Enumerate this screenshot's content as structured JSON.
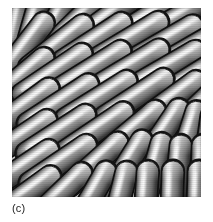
{
  "figure": {
    "caption_label": "(c)",
    "panel": {
      "alt_description": "Grayscale 3D rendering of densely packed spherocylindrical rods",
      "width_px": 189,
      "height_px": 189,
      "left_px": 12,
      "top_px": 8,
      "background_color": "#d9d9d9",
      "outline_color": "#141414",
      "rod_light_color": "#e9e9e9",
      "rod_mid_color": "#9a9a9a",
      "rod_dark_color": "#2e2e2e",
      "page_background": "#ffffff",
      "caption_color": "#1c1c1c"
    }
  },
  "chart_data": {
    "type": "scatter",
    "title": "",
    "subtitle": "",
    "xlabel": "",
    "ylabel": "",
    "xlim": [
      0,
      189
    ],
    "ylim": [
      0,
      189
    ],
    "grid": false,
    "legend": null,
    "annotations": [
      "(c)"
    ],
    "render": {
      "style": "shaded-spherocylinders",
      "light_azimuth_deg": 300,
      "rod_radius_px": 11,
      "rod_length_px": 62,
      "dominant_angle_deg": -32,
      "angle_field_note": "rods lie near -32 deg over most of the panel, rotating toward vertical (-90 deg) in the lower-right corner and near the upper-left edge"
    },
    "rods": [
      {
        "x": 6,
        "y": 10,
        "len": 54,
        "angle": -78
      },
      {
        "x": 24,
        "y": 6,
        "len": 50,
        "angle": -74
      },
      {
        "x": 44,
        "y": 12,
        "len": 58,
        "angle": -62
      },
      {
        "x": 70,
        "y": 8,
        "len": 60,
        "angle": -44
      },
      {
        "x": 100,
        "y": 6,
        "len": 64,
        "angle": -36
      },
      {
        "x": 134,
        "y": 10,
        "len": 66,
        "angle": -32
      },
      {
        "x": 168,
        "y": 8,
        "len": 58,
        "angle": -30
      },
      {
        "x": 12,
        "y": 40,
        "len": 62,
        "angle": -52
      },
      {
        "x": 44,
        "y": 38,
        "len": 66,
        "angle": -38
      },
      {
        "x": 80,
        "y": 34,
        "len": 68,
        "angle": -33
      },
      {
        "x": 116,
        "y": 32,
        "len": 68,
        "angle": -31
      },
      {
        "x": 152,
        "y": 34,
        "len": 64,
        "angle": -30
      },
      {
        "x": 182,
        "y": 38,
        "len": 56,
        "angle": -30
      },
      {
        "x": 8,
        "y": 70,
        "len": 60,
        "angle": -40
      },
      {
        "x": 40,
        "y": 66,
        "len": 70,
        "angle": -34
      },
      {
        "x": 78,
        "y": 62,
        "len": 70,
        "angle": -32
      },
      {
        "x": 116,
        "y": 60,
        "len": 70,
        "angle": -31
      },
      {
        "x": 154,
        "y": 60,
        "len": 66,
        "angle": -30
      },
      {
        "x": 184,
        "y": 66,
        "len": 54,
        "angle": -32
      },
      {
        "x": 10,
        "y": 100,
        "len": 64,
        "angle": -36
      },
      {
        "x": 46,
        "y": 96,
        "len": 70,
        "angle": -33
      },
      {
        "x": 84,
        "y": 92,
        "len": 70,
        "angle": -32
      },
      {
        "x": 122,
        "y": 90,
        "len": 68,
        "angle": -33
      },
      {
        "x": 158,
        "y": 92,
        "len": 62,
        "angle": -36
      },
      {
        "x": 186,
        "y": 98,
        "len": 52,
        "angle": -44
      },
      {
        "x": 8,
        "y": 130,
        "len": 62,
        "angle": -34
      },
      {
        "x": 44,
        "y": 126,
        "len": 68,
        "angle": -33
      },
      {
        "x": 82,
        "y": 124,
        "len": 68,
        "angle": -34
      },
      {
        "x": 118,
        "y": 124,
        "len": 64,
        "angle": -40
      },
      {
        "x": 150,
        "y": 126,
        "len": 58,
        "angle": -56
      },
      {
        "x": 176,
        "y": 130,
        "len": 54,
        "angle": -72
      },
      {
        "x": 196,
        "y": 134,
        "len": 50,
        "angle": -82
      },
      {
        "x": 10,
        "y": 160,
        "len": 62,
        "angle": -34
      },
      {
        "x": 46,
        "y": 156,
        "len": 66,
        "angle": -34
      },
      {
        "x": 82,
        "y": 156,
        "len": 62,
        "angle": -42
      },
      {
        "x": 114,
        "y": 158,
        "len": 58,
        "angle": -58
      },
      {
        "x": 142,
        "y": 162,
        "len": 54,
        "angle": -74
      },
      {
        "x": 166,
        "y": 164,
        "len": 52,
        "angle": -84
      },
      {
        "x": 190,
        "y": 164,
        "len": 52,
        "angle": -88
      },
      {
        "x": 14,
        "y": 186,
        "len": 58,
        "angle": -36
      },
      {
        "x": 48,
        "y": 186,
        "len": 58,
        "angle": -44
      },
      {
        "x": 80,
        "y": 188,
        "len": 54,
        "angle": -60
      },
      {
        "x": 108,
        "y": 190,
        "len": 52,
        "angle": -76
      },
      {
        "x": 134,
        "y": 190,
        "len": 52,
        "angle": -86
      },
      {
        "x": 160,
        "y": 190,
        "len": 52,
        "angle": -88
      },
      {
        "x": 186,
        "y": 190,
        "len": 52,
        "angle": -88
      }
    ]
  }
}
